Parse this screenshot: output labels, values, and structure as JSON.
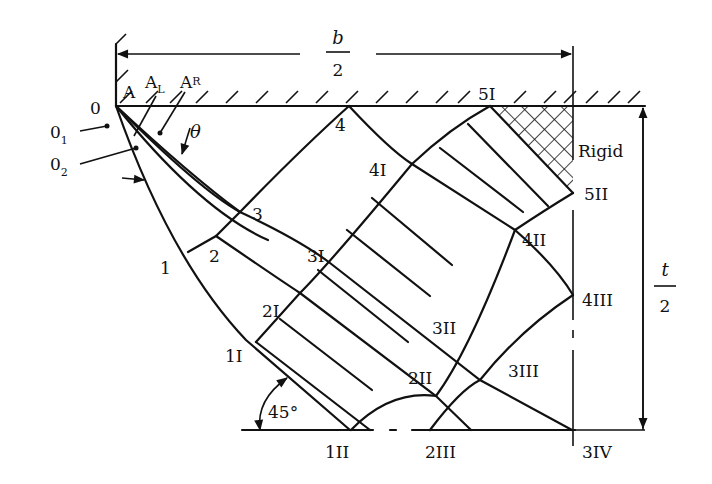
{
  "diagram": {
    "type": "slip-line field diagram",
    "dimensions": {
      "width_label_num": "b",
      "width_label_den": "2",
      "height_label_num": "t",
      "height_label_den": "2"
    },
    "region_label": "Rigid",
    "angle_label": "45°",
    "theta_label": "θ",
    "origin_labels": {
      "origin": "0",
      "o1_main": "0",
      "o1_sub": "1",
      "o2_main": "0",
      "o2_sub": "2"
    },
    "top_labels": {
      "a": "A",
      "al_main": "A",
      "al_sub": "L",
      "ar_main": "A",
      "ar_sub": "R"
    },
    "nodes": {
      "n1": "1",
      "n2": "2",
      "n3": "3",
      "n4": "4",
      "n1I": "1I",
      "n2I": "2I",
      "n3I": "3I",
      "n4I": "4I",
      "n5I": "5I",
      "n1II": "1II",
      "n2II": "2II",
      "n3II": "3II",
      "n4II": "4II",
      "n5II": "5II",
      "n2III": "2III",
      "n3III": "3III",
      "n4III": "4III",
      "n3IV": "3IV"
    }
  }
}
